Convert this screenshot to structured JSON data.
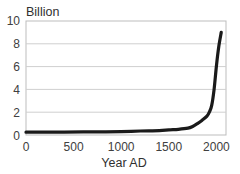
{
  "chart_data": {
    "type": "line",
    "title": "",
    "ylabel": "Billion",
    "xlabel": "Year AD",
    "xlim": [
      0,
      2100
    ],
    "ylim": [
      0,
      10
    ],
    "xticks": [
      0,
      500,
      1000,
      1500,
      2000
    ],
    "yticks": [
      0,
      2,
      4,
      6,
      8,
      10
    ],
    "grid": "horizontal",
    "legend": "none",
    "series": [
      {
        "name": "World population",
        "color": "#1a1a1a",
        "x": [
          0,
          200,
          400,
          600,
          800,
          1000,
          1200,
          1400,
          1500,
          1600,
          1700,
          1750,
          1800,
          1850,
          1900,
          1925,
          1950,
          1975,
          2000,
          2025,
          2050
        ],
        "values": [
          0.25,
          0.25,
          0.26,
          0.27,
          0.28,
          0.3,
          0.35,
          0.38,
          0.45,
          0.5,
          0.6,
          0.75,
          1.0,
          1.3,
          1.65,
          2.0,
          2.6,
          4.0,
          6.1,
          7.8,
          9.0
        ]
      }
    ]
  },
  "labels": {
    "y_title": "Billion",
    "x_title": "Year AD",
    "y_ticks": [
      "0",
      "2",
      "4",
      "6",
      "8",
      "10"
    ],
    "x_ticks": [
      "0",
      "500",
      "1000",
      "1500",
      "2000"
    ]
  }
}
